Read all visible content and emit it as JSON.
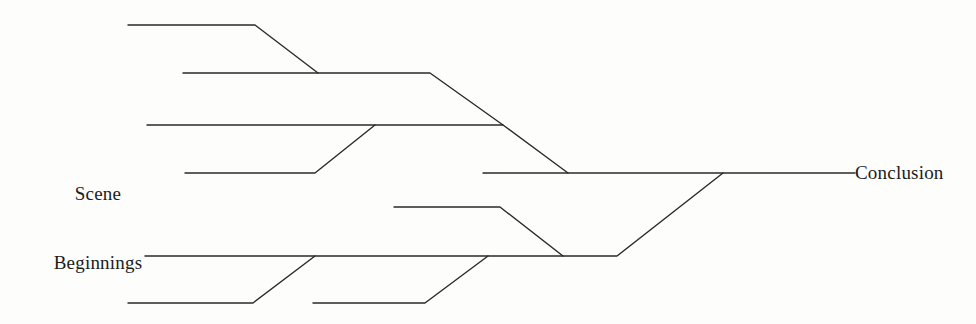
{
  "figure": {
    "type": "flow-diagram",
    "background_color": "#fdfdfc",
    "line_color": "#2a2a2a",
    "line_width": 1.4,
    "width": 976,
    "height": 324,
    "labels": {
      "left_line1": "Scene",
      "left_line2": "Beginnings",
      "right": "Conclusion"
    },
    "tracks": [
      {
        "name": "track-1-top",
        "points": "128,25 255,25 318,73"
      },
      {
        "name": "track-2",
        "points": "183,73 430,73 503,125"
      },
      {
        "name": "track-3",
        "points": "147,125 503,125 568,173"
      },
      {
        "name": "track-4",
        "points": "185,173 315,173 375,125"
      },
      {
        "name": "track-5-mid",
        "points": "394,207 500,207 563,256"
      },
      {
        "name": "track-6",
        "points": "145,256 617,256 723,173"
      },
      {
        "name": "track-7-bottom-left",
        "points": "128,303 253,303 315,256"
      },
      {
        "name": "track-8-bottom-right",
        "points": "313,303 425,303 488,256"
      },
      {
        "name": "track-9-conclusion",
        "points": "483,173 855,173"
      }
    ]
  }
}
